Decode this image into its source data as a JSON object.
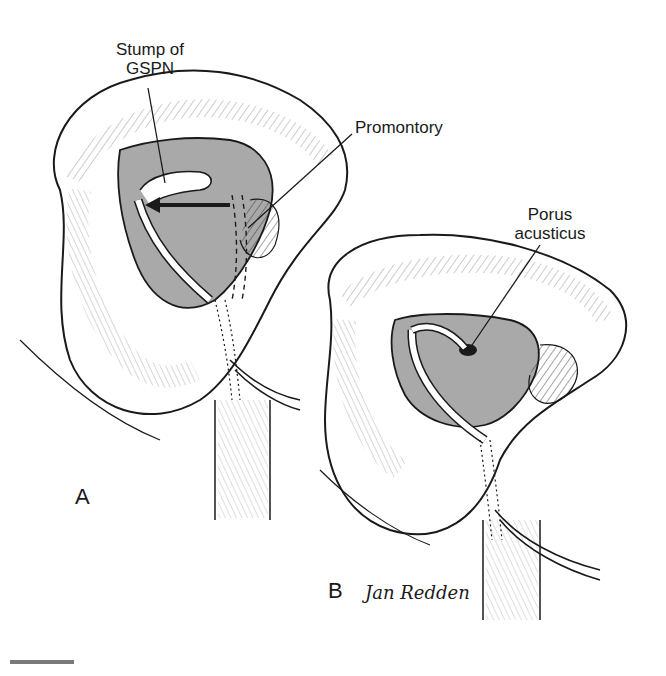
{
  "figure": {
    "panels": [
      {
        "id": "A",
        "letter": "A"
      },
      {
        "id": "B",
        "letter": "B"
      }
    ],
    "labels": {
      "gspn_line1": "Stump of",
      "gspn_line2": "GSPN",
      "promontory": "Promontory",
      "porus_line1": "Porus",
      "porus_line2": "acusticus"
    },
    "signature": "Jan Redden",
    "colors": {
      "ink": "#1a1a1a",
      "shade": "#a9a9a9",
      "background": "#ffffff",
      "scalebar": "#7a7a7a"
    }
  }
}
